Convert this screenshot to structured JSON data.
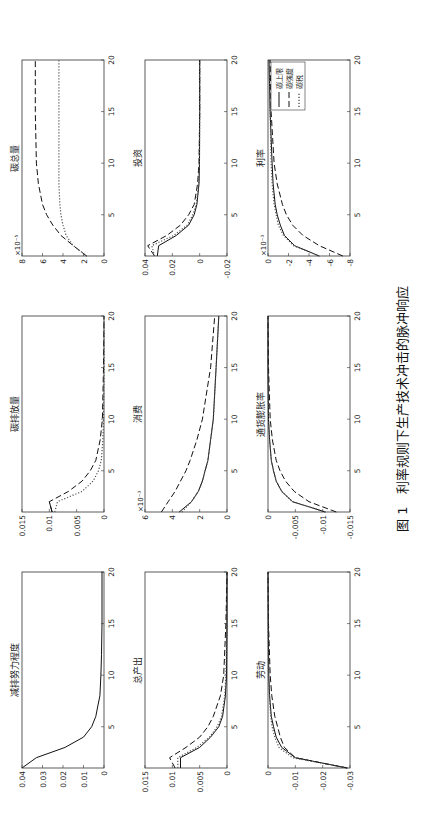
{
  "caption": {
    "label": "图 1",
    "text": "利率规则下生产技术冲击的脉冲响应"
  },
  "legend": [
    {
      "label": "碳上限",
      "style": "solid"
    },
    {
      "label": "碳强度",
      "style": "dashed"
    },
    {
      "label": "碳税",
      "style": "dotted"
    }
  ],
  "chart_data": [
    {
      "type": "line",
      "title": "减排努力程度",
      "xlim": [
        1,
        20
      ],
      "ylim": [
        0,
        0.04
      ],
      "yticks": [
        "0",
        "0.01",
        "0.02",
        "0.03",
        "0.04"
      ],
      "xticks": [
        "5",
        "10",
        "15",
        "20"
      ],
      "multiplier": "",
      "series": [
        {
          "name": "碳上限",
          "style": "solid",
          "x": [
            1,
            2,
            3,
            4,
            5,
            6,
            7,
            8,
            10,
            12,
            15,
            20
          ],
          "values": [
            0.04,
            0.033,
            0.019,
            0.01,
            0.006,
            0.004,
            0.003,
            0.002,
            0.0015,
            0.0012,
            0.001,
            0.001
          ]
        }
      ]
    },
    {
      "type": "line",
      "title": "碳排放量",
      "xlim": [
        1,
        20
      ],
      "ylim": [
        0,
        0.015
      ],
      "yticks": [
        "0",
        "0.005",
        "0.01",
        "0.015"
      ],
      "xticks": [
        "5",
        "10",
        "15",
        "20"
      ],
      "multiplier": "",
      "series": [
        {
          "name": "碳上限",
          "style": "solid",
          "x": [
            1,
            2
          ],
          "values": [
            0.0095,
            0.01
          ]
        },
        {
          "name": "碳强度",
          "style": "dashed",
          "x": [
            1,
            2,
            3,
            4,
            5,
            6,
            8,
            10,
            15,
            20
          ],
          "values": [
            0.0095,
            0.01,
            0.0065,
            0.004,
            0.0025,
            0.0015,
            0.0007,
            0.0003,
            0.0001,
            0
          ]
        },
        {
          "name": "碳税",
          "style": "dotted",
          "x": [
            1,
            2,
            3,
            4,
            5,
            6,
            8,
            10,
            15,
            20
          ],
          "values": [
            0.009,
            0.0085,
            0.004,
            0.002,
            0.001,
            0.0005,
            0.0002,
            0.0001,
            0,
            0
          ]
        }
      ]
    },
    {
      "type": "line",
      "title": "碳总量",
      "xlim": [
        1,
        20
      ],
      "ylim": [
        0,
        8
      ],
      "yticks": [
        "0",
        "2",
        "4",
        "6",
        "8"
      ],
      "xticks": [
        "5",
        "10",
        "15",
        "20"
      ],
      "multiplier": "×10⁻⁵",
      "series": [
        {
          "name": "碳强度",
          "style": "dashed",
          "x": [
            1,
            2,
            3,
            4,
            5,
            6,
            8,
            10,
            15,
            20
          ],
          "values": [
            1.7,
            3.0,
            4.2,
            5.0,
            5.6,
            6.0,
            6.4,
            6.6,
            6.7,
            6.7
          ]
        },
        {
          "name": "碳税",
          "style": "dotted",
          "x": [
            1,
            2,
            3,
            4,
            5,
            6,
            8,
            10,
            15,
            20
          ],
          "values": [
            1.7,
            3.0,
            3.7,
            4.0,
            4.2,
            4.3,
            4.4,
            4.4,
            4.4,
            4.4
          ]
        }
      ]
    },
    {
      "type": "line",
      "title": "总产出",
      "xlim": [
        1,
        20
      ],
      "ylim": [
        0,
        0.015
      ],
      "yticks": [
        "0",
        "0.005",
        "0.01",
        "0.015"
      ],
      "xticks": [
        "5",
        "10",
        "15",
        "20"
      ],
      "multiplier": "",
      "series": [
        {
          "name": "碳上限",
          "style": "solid",
          "x": [
            1,
            2,
            3,
            4,
            5,
            6,
            8,
            10,
            15,
            20
          ],
          "values": [
            0.0085,
            0.0085,
            0.005,
            0.003,
            0.0015,
            0.0008,
            0.0003,
            0.0001,
            0,
            0
          ]
        },
        {
          "name": "碳强度",
          "style": "dashed",
          "x": [
            1,
            2,
            3,
            4,
            5,
            6,
            8,
            10,
            15,
            20
          ],
          "values": [
            0.0095,
            0.0105,
            0.0075,
            0.005,
            0.0035,
            0.0025,
            0.0012,
            0.0006,
            0.0002,
            0
          ]
        },
        {
          "name": "碳税",
          "style": "dotted",
          "x": [
            1,
            2,
            3,
            4,
            5,
            6,
            8,
            10,
            15,
            20
          ],
          "values": [
            0.009,
            0.009,
            0.0055,
            0.0032,
            0.0018,
            0.001,
            0.0004,
            0.0002,
            0,
            0
          ]
        }
      ]
    },
    {
      "type": "line",
      "title": "消费",
      "xlim": [
        1,
        20
      ],
      "ylim": [
        0,
        6
      ],
      "yticks": [
        "0",
        "2",
        "4",
        "6"
      ],
      "xticks": [
        "5",
        "10",
        "15",
        "20"
      ],
      "multiplier": "×10⁻³",
      "series": [
        {
          "name": "碳上限",
          "style": "solid",
          "x": [
            1,
            2,
            3,
            4,
            5,
            6,
            8,
            10,
            15,
            20
          ],
          "values": [
            3.5,
            2.6,
            2.1,
            1.8,
            1.6,
            1.4,
            1.2,
            1.0,
            0.8,
            0.6
          ]
        },
        {
          "name": "碳强度",
          "style": "dashed",
          "x": [
            1,
            2,
            3,
            4,
            5,
            6,
            8,
            10,
            15,
            20
          ],
          "values": [
            4.8,
            4.3,
            3.8,
            3.4,
            3.0,
            2.7,
            2.2,
            1.8,
            1.2,
            0.9
          ]
        },
        {
          "name": "碳税",
          "style": "dotted",
          "x": [
            1,
            2,
            3,
            4,
            5,
            6,
            8,
            10,
            15,
            20
          ],
          "values": [
            3.3,
            2.6,
            2.1,
            1.8,
            1.6,
            1.4,
            1.2,
            1.0,
            0.8,
            0.6
          ]
        }
      ]
    },
    {
      "type": "line",
      "title": "投资",
      "xlim": [
        1,
        20
      ],
      "ylim": [
        -0.02,
        0.04
      ],
      "yticks": [
        "-0.02",
        "0",
        "0.02",
        "0.04"
      ],
      "xticks": [
        "5",
        "10",
        "15",
        "20"
      ],
      "multiplier": "",
      "series": [
        {
          "name": "碳上限",
          "style": "solid",
          "x": [
            1,
            2,
            3,
            4,
            5,
            6,
            8,
            10,
            15,
            20
          ],
          "values": [
            0.031,
            0.03,
            0.017,
            0.008,
            0.004,
            0.002,
            0.0005,
            0.0001,
            0,
            0
          ]
        },
        {
          "name": "碳强度",
          "style": "dashed",
          "x": [
            1,
            2,
            3,
            4,
            5,
            6,
            8,
            10,
            15,
            20
          ],
          "values": [
            0.033,
            0.038,
            0.024,
            0.014,
            0.008,
            0.004,
            0.0015,
            0.0005,
            0,
            0
          ]
        },
        {
          "name": "碳税",
          "style": "dotted",
          "x": [
            1,
            2,
            3,
            4,
            5,
            6,
            8,
            10,
            15,
            20
          ],
          "values": [
            0.033,
            0.035,
            0.019,
            0.009,
            0.005,
            0.0025,
            0.0007,
            0.0002,
            0,
            0
          ]
        }
      ]
    },
    {
      "type": "line",
      "title": "劳动",
      "xlim": [
        1,
        20
      ],
      "ylim": [
        -0.03,
        0
      ],
      "yticks": [
        "-0.03",
        "-0.02",
        "-0.01",
        "0"
      ],
      "xticks": [
        "5",
        "10",
        "15",
        "20"
      ],
      "multiplier": "",
      "series": [
        {
          "name": "碳上限",
          "style": "solid",
          "x": [
            1,
            2,
            3,
            4,
            5,
            6,
            8,
            10,
            15,
            20
          ],
          "values": [
            -0.029,
            -0.01,
            -0.005,
            -0.003,
            -0.002,
            -0.0012,
            -0.0006,
            -0.0003,
            -0.0001,
            0
          ]
        },
        {
          "name": "碳强度",
          "style": "dashed",
          "x": [
            1,
            2,
            3,
            4,
            5,
            6,
            8,
            10,
            15,
            20
          ],
          "values": [
            -0.029,
            -0.01,
            -0.006,
            -0.0045,
            -0.0035,
            -0.0025,
            -0.0014,
            -0.0008,
            -0.0002,
            0
          ]
        },
        {
          "name": "碳税",
          "style": "dotted",
          "x": [
            1,
            2,
            3,
            4,
            5,
            6,
            8,
            10,
            15,
            20
          ],
          "values": [
            -0.029,
            -0.009,
            -0.004,
            -0.0025,
            -0.0015,
            -0.001,
            -0.0005,
            -0.0002,
            0,
            0
          ]
        }
      ]
    },
    {
      "type": "line",
      "title": "通货膨胀率",
      "xlim": [
        1,
        20
      ],
      "ylim": [
        -0.015,
        0
      ],
      "yticks": [
        "-0.015",
        "-0.01",
        "-0.005",
        "0"
      ],
      "xticks": [
        "5",
        "10",
        "15",
        "20"
      ],
      "multiplier": "",
      "series": [
        {
          "name": "碳上限",
          "style": "solid",
          "x": [
            1,
            2,
            3,
            4,
            5,
            6,
            8,
            10,
            15,
            20
          ],
          "values": [
            -0.0105,
            -0.0045,
            -0.0025,
            -0.0015,
            -0.001,
            -0.0006,
            -0.0003,
            -0.0001,
            0,
            0
          ]
        },
        {
          "name": "碳强度",
          "style": "dashed",
          "x": [
            1,
            2,
            3,
            4,
            5,
            6,
            8,
            10,
            15,
            20
          ],
          "values": [
            -0.0125,
            -0.0075,
            -0.0048,
            -0.0032,
            -0.0022,
            -0.0015,
            -0.0008,
            -0.0004,
            -0.0001,
            0
          ]
        },
        {
          "name": "碳税",
          "style": "dotted",
          "x": [
            1,
            2,
            3,
            4,
            5,
            6,
            8,
            10,
            15,
            20
          ],
          "values": [
            -0.0105,
            -0.0045,
            -0.0025,
            -0.0015,
            -0.001,
            -0.0006,
            -0.0003,
            -0.0001,
            0,
            0
          ]
        }
      ]
    },
    {
      "type": "line",
      "title": "利率",
      "xlim": [
        1,
        20
      ],
      "ylim": [
        -8,
        0
      ],
      "yticks": [
        "-8",
        "-6",
        "-4",
        "-2",
        "0"
      ],
      "xticks": [
        "5",
        "10",
        "15",
        "20"
      ],
      "multiplier": "×10⁻³",
      "series": [
        {
          "name": "碳上限",
          "style": "solid",
          "x": [
            1,
            2,
            3,
            4,
            5,
            6,
            8,
            10,
            15,
            20
          ],
          "values": [
            -5.0,
            -2.6,
            -1.6,
            -1.2,
            -0.9,
            -0.7,
            -0.5,
            -0.4,
            -0.2,
            -0.1
          ]
        },
        {
          "name": "碳强度",
          "style": "dashed",
          "x": [
            1,
            2,
            3,
            4,
            5,
            6,
            8,
            10,
            15,
            20
          ],
          "values": [
            -7.3,
            -5.0,
            -3.4,
            -2.4,
            -1.8,
            -1.4,
            -0.9,
            -0.6,
            -0.3,
            -0.2
          ]
        },
        {
          "name": "碳税",
          "style": "dotted",
          "x": [
            1,
            2,
            3,
            4,
            5,
            6,
            8,
            10,
            15,
            20
          ],
          "values": [
            -5.0,
            -2.5,
            -1.5,
            -1.0,
            -0.8,
            -0.6,
            -0.4,
            -0.3,
            -0.2,
            -0.1
          ]
        }
      ]
    }
  ]
}
